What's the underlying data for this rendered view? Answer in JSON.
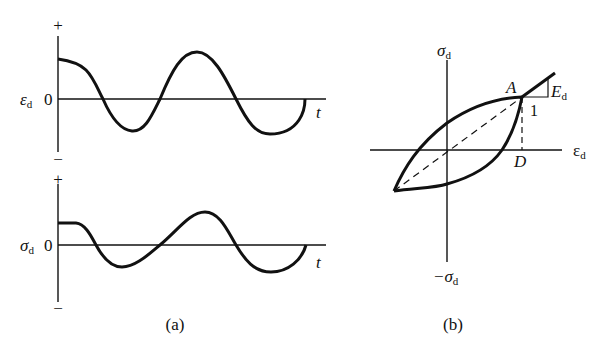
{
  "figure": {
    "panel_a": {
      "caption": "(a)",
      "top_plot": {
        "y_label": "ε",
        "y_label_sub": "d",
        "zero_label": "0",
        "x_label": "t",
        "plus": "+",
        "minus": "−"
      },
      "bottom_plot": {
        "y_label": "σ",
        "y_label_sub": "d",
        "zero_label": "0",
        "x_label": "t",
        "plus": "+",
        "minus": "−"
      }
    },
    "panel_b": {
      "caption": "(b)",
      "y_axis_top_label": "σ",
      "y_axis_top_sub": "d",
      "y_axis_bottom_label": "−σ",
      "y_axis_bottom_sub": "d",
      "x_axis_label": "ε",
      "x_axis_sub": "d",
      "point_a": "A",
      "point_d": "D",
      "slope_label": "E",
      "slope_sub": "d",
      "slope_run": "1"
    }
  }
}
